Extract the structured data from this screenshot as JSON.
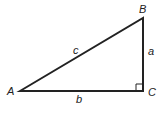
{
  "diagram": {
    "type": "right-triangle",
    "stroke_color": "#222222",
    "background": "#ffffff",
    "vertices": {
      "A": {
        "label": "A",
        "x": 20,
        "y": 91
      },
      "B": {
        "label": "B",
        "x": 143,
        "y": 18
      },
      "C": {
        "label": "C",
        "x": 143,
        "y": 91
      }
    },
    "sides": {
      "a": {
        "label": "a",
        "between": [
          "B",
          "C"
        ]
      },
      "b": {
        "label": "b",
        "between": [
          "A",
          "C"
        ]
      },
      "c": {
        "label": "c",
        "between": [
          "A",
          "B"
        ]
      }
    },
    "right_angle_at": "C"
  }
}
